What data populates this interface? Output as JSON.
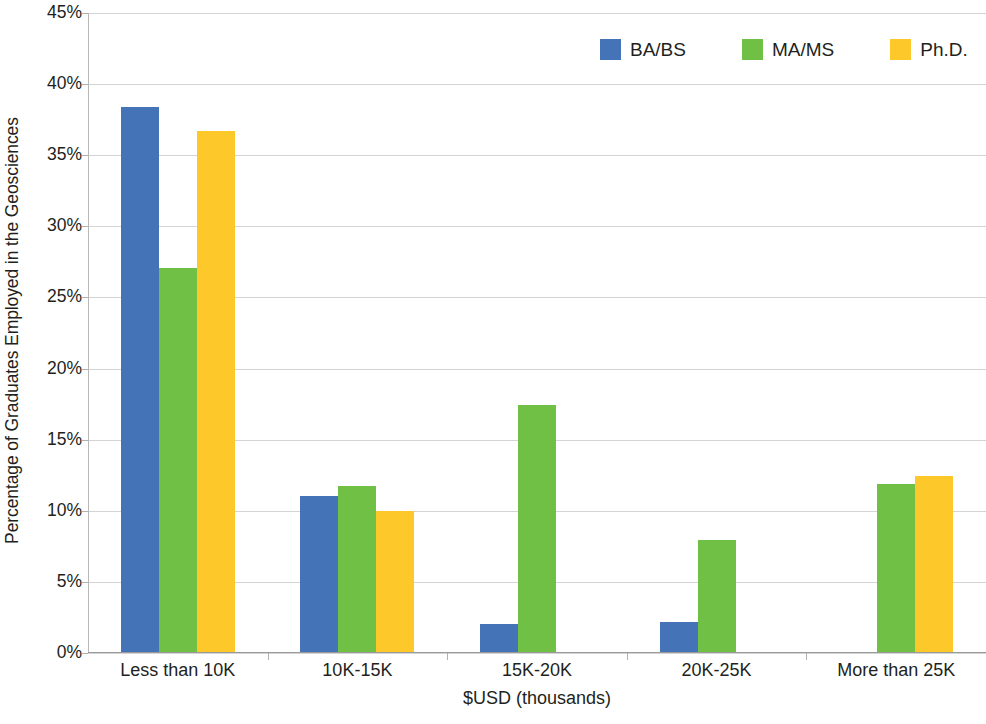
{
  "chart_data": {
    "type": "bar",
    "title": "",
    "xlabel": "$USD (thousands)",
    "ylabel": "Percentage of Graduates Employed in the Geosciences",
    "categories": [
      "Less than 10K",
      "10K-15K",
      "15K-20K",
      "20K-25K",
      "More than 25K"
    ],
    "series": [
      {
        "name": "BA/BS",
        "color": "#4573b8",
        "values": [
          38.3,
          11.0,
          2.0,
          2.1,
          0
        ]
      },
      {
        "name": "MA/MS",
        "color": "#6fc044",
        "values": [
          27.0,
          11.7,
          17.4,
          7.9,
          11.8
        ]
      },
      {
        "name": "Ph.D.",
        "color": "#fdc829",
        "values": [
          36.6,
          9.9,
          0,
          0,
          12.4
        ]
      }
    ],
    "ylim": [
      0,
      45
    ],
    "ytick_step": 5,
    "ytick_labels": [
      "0%",
      "5%",
      "10%",
      "15%",
      "20%",
      "25%",
      "30%",
      "35%",
      "40%",
      "45%"
    ],
    "ytick_values": [
      0,
      5,
      10,
      15,
      20,
      25,
      30,
      35,
      40,
      45
    ],
    "grid": true,
    "legend_position": "top-right",
    "value_suffix": "%"
  },
  "legend": {
    "items": [
      {
        "label": "BA/BS",
        "color": "#4573b8"
      },
      {
        "label": "MA/MS",
        "color": "#6fc044"
      },
      {
        "label": "Ph.D.",
        "color": "#fdc829"
      }
    ]
  },
  "axes": {
    "x_title": "$USD (thousands)",
    "y_title": "Percentage of Graduates Employed in the Geosciences"
  },
  "colors": {
    "ba_bs": "#4573b8",
    "ma_ms": "#6fc044",
    "phd": "#fdc829",
    "gridline": "#d4d4d4",
    "axis": "#9a9a9a",
    "text": "#231f20",
    "background": "#ffffff"
  }
}
